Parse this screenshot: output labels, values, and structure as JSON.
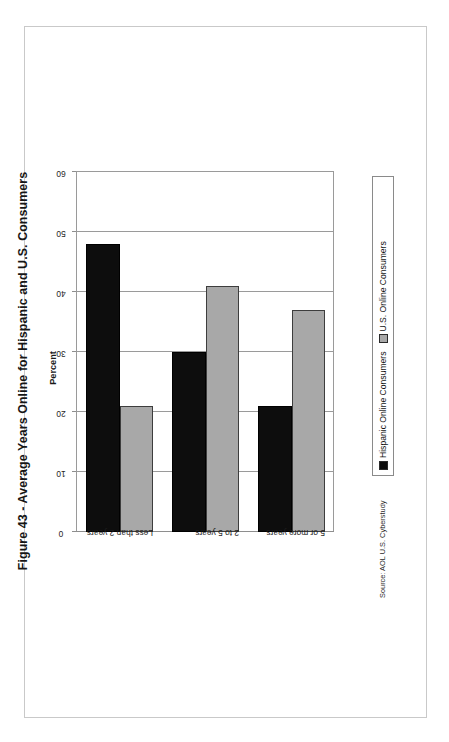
{
  "figure": {
    "title": "Figure 43 - Average Years Online for Hispanic and U.S. Consumers",
    "source_note": "Source: AOL U.S. Cyberstudy",
    "orientation": "rotated-90-ccw"
  },
  "legend": {
    "items": [
      {
        "label": "Hispanic Online Consumers",
        "color": "#0d0d0d",
        "swatch": "filled-square-icon"
      },
      {
        "label": "U.S. Online  Consumers",
        "color": "#a8a8a8",
        "swatch": "filled-square-icon"
      }
    ]
  },
  "chart_data": {
    "type": "bar",
    "orientation": "horizontal",
    "title": "",
    "xlabel": "Percent",
    "ylabel": "",
    "xlim": [
      0,
      60
    ],
    "xticks": [
      "0",
      "10",
      "20",
      "30",
      "40",
      "50",
      "60"
    ],
    "grid": true,
    "legend_position": "right",
    "categories": [
      "Less than 2 years",
      "2 to 5 years",
      "5 or more years"
    ],
    "series": [
      {
        "name": "Hispanic Online Consumers",
        "color": "#0d0d0d",
        "values": [
          48,
          30,
          21
        ]
      },
      {
        "name": "U.S. Online  Consumers",
        "color": "#a8a8a8",
        "values": [
          21,
          41,
          37
        ]
      }
    ],
    "axis_title": "Percent"
  }
}
